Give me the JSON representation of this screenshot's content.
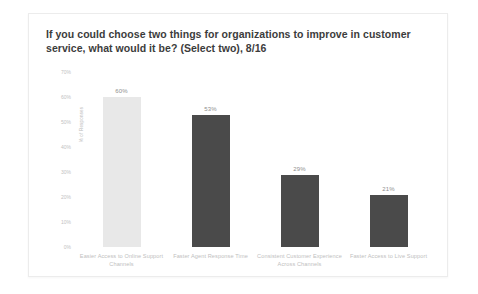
{
  "card": {
    "background": "#ffffff",
    "border_color": "#ececec"
  },
  "chart_data": {
    "type": "bar",
    "title": "If you could choose two things for organizations to improve in customer service, what would it be? (Select two), 8/16",
    "xlabel": "",
    "ylabel": "% of Responses",
    "ylim": [
      0,
      70
    ],
    "grid": false,
    "legend": null,
    "categories": [
      "Easier Access to Online Support Channels",
      "Faster Agent Response Time",
      "Consistent Customer Experience Across Channels",
      "Faster Access to Live Support"
    ],
    "values": [
      60,
      53,
      29,
      21
    ],
    "value_labels": [
      "60%",
      "53%",
      "29%",
      "21%"
    ],
    "bar_colors": [
      "#e8e8e8",
      "#4a4a4a",
      "#4a4a4a",
      "#4a4a4a"
    ],
    "ytick_labels": [
      "70%",
      "60%",
      "50%",
      "40%",
      "30%",
      "20%",
      "10%",
      "0%"
    ],
    "ytick_values": [
      70,
      60,
      50,
      40,
      30,
      20,
      10,
      0
    ],
    "ytick_color": "#c2c2c2",
    "category_label_color": "#c0c0c0",
    "value_label_color": "#8e8e8e"
  }
}
